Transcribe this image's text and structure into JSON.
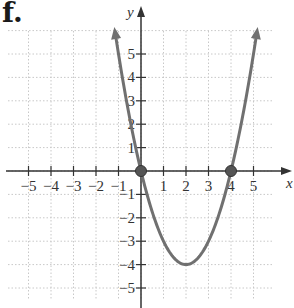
{
  "figure_label": "f.",
  "chart_data": {
    "type": "line",
    "title": "",
    "function": "y = x^2 - 4x",
    "xlabel": "x",
    "ylabel": "y",
    "xlim": [
      -6,
      6
    ],
    "ylim": [
      -6,
      6
    ],
    "grid": true,
    "x_ticks": [
      -5,
      -4,
      -3,
      -2,
      -1,
      1,
      2,
      3,
      4,
      5
    ],
    "y_ticks": [
      5,
      4,
      3,
      2,
      1,
      -1,
      -2,
      -3,
      -4,
      -5
    ],
    "x_tick_labels": [
      "−5",
      "−4",
      "−3",
      "−2",
      "−1",
      "1",
      "2",
      "3",
      "4",
      "5"
    ],
    "y_tick_labels": [
      "5",
      "4",
      "3",
      "2",
      "1",
      "−1",
      "−2",
      "−3",
      "−4",
      "−5"
    ],
    "series": [
      {
        "name": "parabola",
        "color": "#707070",
        "x": [
          -1,
          -0.5,
          0,
          0.5,
          1,
          1.5,
          2,
          2.5,
          3,
          3.5,
          4,
          4.5,
          5
        ],
        "y": [
          5,
          2.25,
          0,
          -1.75,
          -3,
          -3.75,
          -4,
          -3.75,
          -3,
          -1.75,
          0,
          2.25,
          5
        ]
      }
    ],
    "highlighted_points": [
      {
        "x": 0,
        "y": 0,
        "label": "x-intercept"
      },
      {
        "x": 4,
        "y": 0,
        "label": "x-intercept"
      }
    ],
    "vertex": {
      "x": 2,
      "y": -4
    }
  }
}
